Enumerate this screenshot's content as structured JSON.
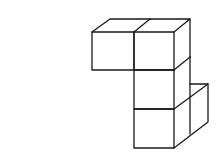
{
  "diagram": {
    "type": "isometric-cube-stack",
    "cube_count": 5,
    "stroke_color": "#1a1a1a",
    "background": "#ffffff",
    "cubes": [
      {
        "name": "top-left-cube",
        "position": "column-left, row-top"
      },
      {
        "name": "top-right-cube",
        "position": "column-right, row-top"
      },
      {
        "name": "middle-cube",
        "position": "column-right, row-middle"
      },
      {
        "name": "bottom-front-cube",
        "position": "column-right, row-bottom, front"
      },
      {
        "name": "bottom-back-cube",
        "position": "column-right, row-bottom, back-right"
      }
    ]
  }
}
